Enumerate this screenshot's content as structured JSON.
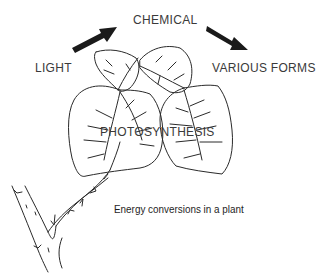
{
  "diagram": {
    "labels": {
      "light": "LIGHT",
      "chemical": "CHEMICAL",
      "various_forms": "VARIOUS FORMS",
      "photosynthesis": "PHOTOSYNTHESIS"
    },
    "caption": "Energy conversions in a plant",
    "colors": {
      "line": "#2a2a2a",
      "arrow": "#1a1a1a",
      "text": "#3a3a3a",
      "background": "#ffffff"
    },
    "arrows": [
      {
        "from": "LIGHT",
        "to": "CHEMICAL",
        "direction": "up-right"
      },
      {
        "from": "CHEMICAL",
        "to": "VARIOUS FORMS",
        "direction": "down-right"
      }
    ]
  }
}
